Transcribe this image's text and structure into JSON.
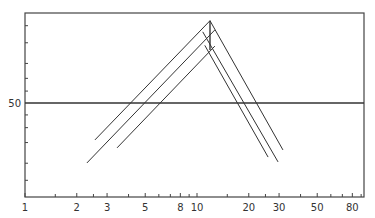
{
  "chart_data": {
    "type": "line",
    "title": "",
    "xlabel": "",
    "ylabel": "",
    "x_scale": "log",
    "y_scale": "probability (normal)",
    "xlim": [
      1,
      94
    ],
    "ylim_approx_percent": [
      3.5,
      99
    ],
    "x_tick_labels": [
      "1",
      "2",
      "3",
      "5",
      "8",
      "10",
      "20",
      "30",
      "50",
      "80"
    ],
    "x_minor_ticks": [
      1.5,
      2.5,
      4,
      6,
      7,
      9,
      15,
      25,
      40,
      60,
      70,
      90
    ],
    "y_tick_labels": [
      "50"
    ],
    "y_ticks_unlabeled_approx": [
      5,
      10,
      20,
      30,
      40,
      60,
      70,
      80,
      90,
      95
    ],
    "reference_line": {
      "y": 50,
      "label": "50"
    },
    "grid": false,
    "legend": null,
    "series": [
      {
        "name": "rising-1",
        "points": [
          [
            2.55,
            21.6
          ],
          [
            11.9,
            96
          ]
        ]
      },
      {
        "name": "rising-2",
        "points": [
          [
            2.29,
            10.1
          ],
          [
            12.7,
            94
          ]
        ]
      },
      {
        "name": "rising-3",
        "points": [
          [
            3.43,
            17
          ],
          [
            12.7,
            88.7
          ]
        ]
      },
      {
        "name": "falling-1",
        "points": [
          [
            11.9,
            96
          ],
          [
            31.6,
            15.9
          ]
        ]
      },
      {
        "name": "falling-2",
        "points": [
          [
            10.8,
            93.5
          ],
          [
            29.6,
            10.5
          ]
        ]
      },
      {
        "name": "falling-3",
        "points": [
          [
            11.1,
            89
          ],
          [
            25.9,
            12.5
          ]
        ]
      },
      {
        "name": "vertical",
        "points": [
          [
            11.9,
            96
          ],
          [
            11.9,
            87
          ]
        ]
      }
    ]
  }
}
